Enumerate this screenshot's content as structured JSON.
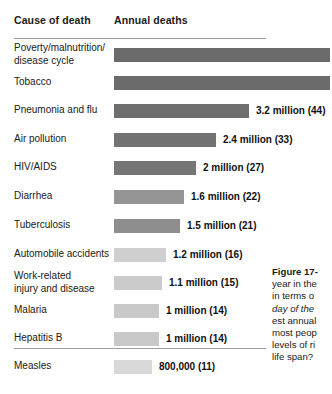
{
  "figure": {
    "header": {
      "cause_label": "Cause of death",
      "annual_label": "Annual deaths"
    },
    "caption": {
      "title": "Figure 17-",
      "lines": [
        {
          "text": "year in the",
          "italic": false
        },
        {
          "text": "in terms o",
          "italic": false
        },
        {
          "text": "day of the",
          "italic": true
        },
        {
          "text": "est annual",
          "italic": false
        },
        {
          "text": "most peop",
          "italic": false
        },
        {
          "text": "levels of ri",
          "italic": false
        },
        {
          "text": "life span?",
          "italic": false
        }
      ]
    }
  },
  "chart_data": {
    "type": "bar",
    "title": "Annual deaths",
    "xlabel": "Annual deaths",
    "ylabel": "Cause of death",
    "orientation": "horizontal",
    "grid": false,
    "legend": false,
    "categories": [
      "Poverty/malnutrition/\ndisease cycle",
      "Tobacco",
      "Pneumonia and flu",
      "Air pollution",
      "HIV/AIDS",
      "Diarrhea",
      "Tuberculosis",
      "Automobile accidents",
      "Work-related\ninjury and disease",
      "Malaria",
      "Hepatitis B",
      "Measles"
    ],
    "values": [
      null,
      null,
      3200000,
      2400000,
      2000000,
      1600000,
      1500000,
      1200000,
      1100000,
      1000000,
      1000000,
      800000
    ],
    "value_labels": [
      "",
      "",
      "3.2 million (44)",
      "2.4 million (33)",
      "2 million (27)",
      "1.6 million (22)",
      "1.5 million (21)",
      "1.2 million (16)",
      "1.1 million (15)",
      "1 million (14)",
      "1 million (14)",
      "800,000 (11)"
    ],
    "bar_colors": [
      "#6b6b6b",
      "#6b6b6b",
      "#6e6e6e",
      "#727272",
      "#757575",
      "#959595",
      "#8e8e8e",
      "#cfcfcf",
      "#cbcbcb",
      "#c9c9c9",
      "#c9c9c9",
      "#d9d9d9"
    ],
    "bars": [
      {
        "label": "Poverty/malnutrition/\ndisease cycle",
        "value_label": "",
        "pixel_end": 330,
        "color": "#6b6b6b",
        "clipped": true,
        "top": 48,
        "label_top": 42
      },
      {
        "label": "Tobacco",
        "value_label": "",
        "pixel_end": 330,
        "color": "#6b6b6b",
        "clipped": true,
        "top": 76,
        "label_top": 76
      },
      {
        "label": "Pneumonia and flu",
        "value_label": "3.2 million (44)",
        "pixel_end": 249,
        "color": "#6e6e6e",
        "clipped": false,
        "top": 104,
        "label_top": 104
      },
      {
        "label": "Air pollution",
        "value_label": "2.4 million (33)",
        "pixel_end": 216,
        "color": "#727272",
        "clipped": false,
        "top": 133,
        "label_top": 133
      },
      {
        "label": "HIV/AIDS",
        "value_label": "2 million (27)",
        "pixel_end": 196,
        "color": "#757575",
        "clipped": false,
        "top": 161,
        "label_top": 161
      },
      {
        "label": "Diarrhea",
        "value_label": "1.6 million (22)",
        "pixel_end": 184,
        "color": "#959595",
        "clipped": false,
        "top": 190,
        "label_top": 190
      },
      {
        "label": "Tuberculosis",
        "value_label": "1.5 million (21)",
        "pixel_end": 180,
        "color": "#8e8e8e",
        "clipped": false,
        "top": 219,
        "label_top": 219
      },
      {
        "label": "Automobile accidents",
        "value_label": "1.2 million (16)",
        "pixel_end": 166,
        "color": "#cfcfcf",
        "clipped": false,
        "top": 248,
        "label_top": 248
      },
      {
        "label": "Work-related\ninjury and disease",
        "value_label": "1.1 million (15)",
        "pixel_end": 162,
        "color": "#cbcbcb",
        "clipped": false,
        "top": 276,
        "label_top": 270
      },
      {
        "label": "Malaria",
        "value_label": "1 million (14)",
        "pixel_end": 159,
        "color": "#c9c9c9",
        "clipped": false,
        "top": 304,
        "label_top": 304
      },
      {
        "label": "Hepatitis B",
        "value_label": "1 million (14)",
        "pixel_end": 159,
        "color": "#c9c9c9",
        "clipped": false,
        "top": 332,
        "label_top": 332
      },
      {
        "label": "Measles",
        "value_label": "800,000 (11)",
        "pixel_end": 152,
        "color": "#d9d9d9",
        "clipped": false,
        "top": 360,
        "label_top": 360
      }
    ]
  }
}
